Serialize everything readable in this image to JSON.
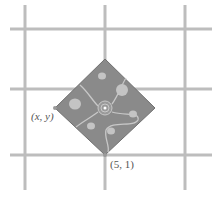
{
  "diagram": {
    "labels": {
      "corner_xy": "(x, y)",
      "corner_51": "(5, 1)"
    },
    "colors": {
      "grid": "#bdbdbd",
      "park_fill": "#8a8a8a",
      "park_edge": "#707070",
      "path": "#c8c8c8",
      "bush": "#c4c4c4"
    },
    "grid": {
      "vertical_x": [
        25,
        105,
        185
      ],
      "horizontal_y": [
        29,
        89,
        155
      ]
    },
    "square_vertices": {
      "top": [
        105,
        59
      ],
      "right": [
        155,
        108
      ],
      "bottom": [
        105,
        155
      ],
      "left": [
        55,
        108
      ]
    }
  }
}
